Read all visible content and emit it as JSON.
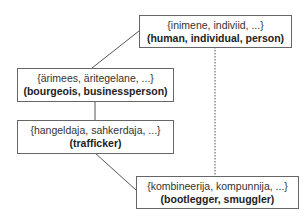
{
  "diagram": {
    "nodes": [
      {
        "id": "human",
        "synset": "{inimene, indiviid, ...}",
        "gloss": "(human, individual, person)"
      },
      {
        "id": "bourgeois",
        "synset": "{ärimees, äritegelane, ...}",
        "gloss": "(bourgeois, businessperson)"
      },
      {
        "id": "trafficker",
        "synset": "{hangeldaja, sahkerdaja, ...}",
        "gloss": "(trafficker)"
      },
      {
        "id": "bootlegger",
        "synset": "{kombineerija, kompunnija, ...}",
        "gloss": "(bootlegger, smuggler)"
      }
    ],
    "edges": [
      {
        "from": "bourgeois",
        "to": "human",
        "style": "solid"
      },
      {
        "from": "trafficker",
        "to": "bourgeois",
        "style": "solid"
      },
      {
        "from": "bootlegger",
        "to": "trafficker",
        "style": "solid"
      },
      {
        "from": "bootlegger",
        "to": "human",
        "style": "dotted"
      }
    ],
    "colors": {
      "line": "#555555",
      "border": "#666666",
      "background": "#ffffff"
    }
  }
}
